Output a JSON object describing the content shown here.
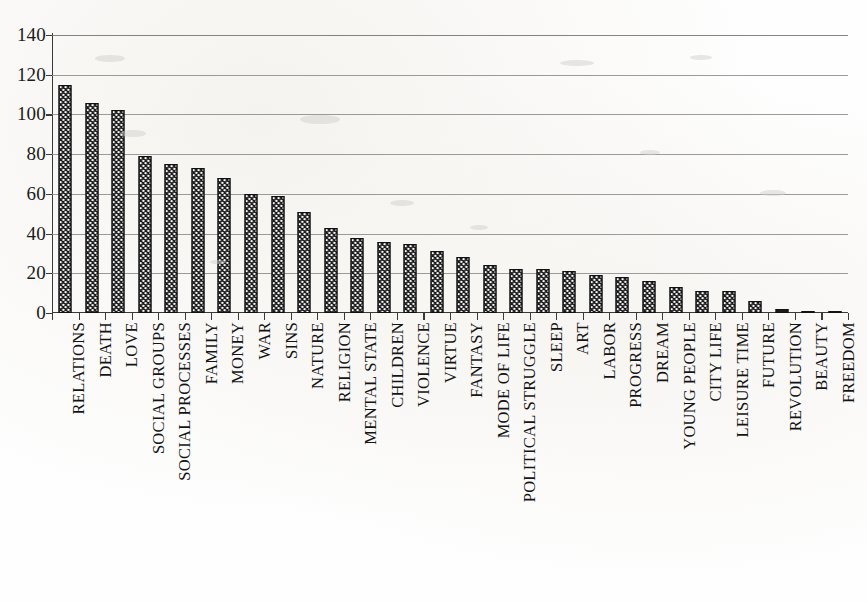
{
  "chart_data": {
    "type": "bar",
    "title": "",
    "subtitle": "",
    "xlabel": "",
    "ylabel": "",
    "ylim": [
      0,
      140
    ],
    "yticks": [
      0,
      20,
      40,
      60,
      80,
      100,
      120,
      140
    ],
    "ytick_labels": [
      "0",
      "20",
      "40",
      "60",
      "80",
      "100",
      "120",
      "140"
    ],
    "grid": true,
    "legend": false,
    "legend_position": "none",
    "orientation": "vertical",
    "bar_color": "#1a1a1a",
    "bar_pattern": "dotted-checker",
    "gridline_color": "#8a8a8a",
    "axis_color": "#3a3a3a",
    "categories": [
      "RELATIONS",
      "DEATH",
      "LOVE",
      "SOCIAL GROUPS",
      "SOCIAL PROCESSES",
      "FAMILY",
      "MONEY",
      "WAR",
      "SINS",
      "NATURE",
      "RELIGION",
      "MENTAL STATE",
      "CHILDREN",
      "VIOLENCE",
      "VIRTUE",
      "FANTASY",
      "MODE OF LIFE",
      "POLITICAL STRUGGLE",
      "SLEEP",
      "ART",
      "LABOR",
      "PROGRESS",
      "DREAM",
      "YOUNG PEOPLE",
      "CITY LIFE",
      "LEISURE TIME",
      "FUTURE",
      "REVOLUTION",
      "BEAUTY",
      "FREEDOM"
    ],
    "values": [
      115,
      106,
      102,
      79,
      75,
      73,
      68,
      60,
      59,
      51,
      43,
      38,
      36,
      35,
      31,
      28,
      24,
      22,
      22,
      21,
      19,
      18,
      16,
      13,
      11,
      11,
      6,
      2,
      1,
      1
    ]
  }
}
